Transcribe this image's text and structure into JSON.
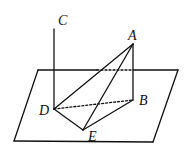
{
  "diagram": {
    "type": "3d-geometry",
    "colors": {
      "stroke": "#111111",
      "background": "#ffffff"
    },
    "points": {
      "A": {
        "label": "A",
        "x": 133,
        "y": 44
      },
      "B": {
        "label": "B",
        "x": 133,
        "y": 100
      },
      "C": {
        "label": "C",
        "x": 54,
        "y": 29
      },
      "D": {
        "label": "D",
        "x": 54,
        "y": 109
      },
      "E": {
        "label": "E",
        "x": 83,
        "y": 130
      }
    },
    "plane": {
      "corners": [
        [
          38,
          70
        ],
        [
          178,
          70
        ],
        [
          153,
          142
        ],
        [
          14,
          141
        ]
      ]
    },
    "segments": [
      {
        "from": "C",
        "to": "D",
        "style": "solid"
      },
      {
        "from": "A",
        "to": "B",
        "style": "solid"
      },
      {
        "from": "A",
        "to": "D",
        "style": "solid"
      },
      {
        "from": "A",
        "to": "E",
        "style": "solid"
      },
      {
        "from": "D",
        "to": "E",
        "style": "solid"
      },
      {
        "from": "E",
        "to": "B",
        "style": "solid"
      },
      {
        "from": "D",
        "to": "B",
        "style": "dashed"
      }
    ]
  },
  "labels": {
    "A": "A",
    "B": "B",
    "C": "C",
    "D": "D",
    "E": "E"
  }
}
